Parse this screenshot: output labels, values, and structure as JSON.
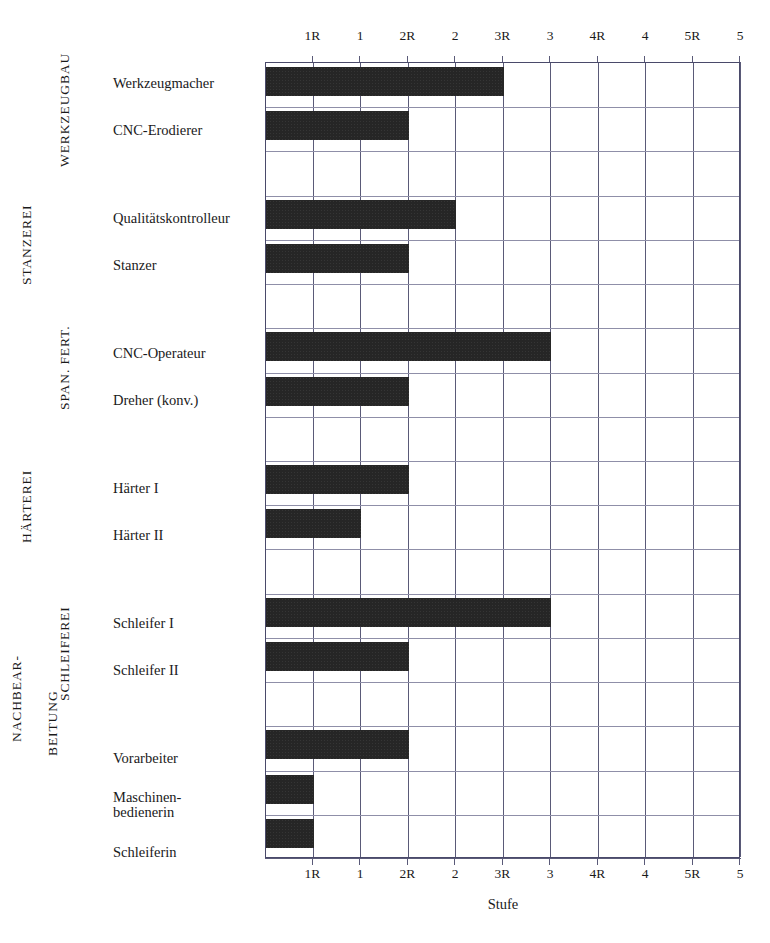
{
  "chart_data": {
    "type": "bar",
    "orientation": "horizontal",
    "title": "",
    "xlabel": "Stufe",
    "ylabel": "",
    "grid": true,
    "legend": null,
    "x_tick_labels": [
      "1R",
      "1",
      "2R",
      "2",
      "3R",
      "3",
      "4R",
      "4",
      "5R",
      "5"
    ],
    "x_tick_values": [
      1,
      2,
      3,
      4,
      5,
      6,
      7,
      8,
      9,
      10
    ],
    "xlim": [
      0,
      10
    ],
    "axis_top_duplicated": true,
    "axis_bottom_duplicated": true,
    "bar_color": "#262626",
    "grid_color": "#5a5a78",
    "groups": [
      {
        "name": "WERKZEUGBAU",
        "categories": [
          "Werkzeugmacher",
          "CNC-Erodierer"
        ],
        "value_labels": [
          "3R",
          "2R"
        ],
        "values": [
          5,
          3
        ]
      },
      {
        "name": "STANZEREI",
        "categories": [
          "Qualitätskontrolleur",
          "Stanzer"
        ],
        "value_labels": [
          "2",
          "2R"
        ],
        "values": [
          4,
          3
        ]
      },
      {
        "name": "SPAN. FERT.",
        "categories": [
          "CNC-Operateur",
          "Dreher (konv.)"
        ],
        "value_labels": [
          "3",
          "2R"
        ],
        "values": [
          6,
          3
        ]
      },
      {
        "name": "HÄRTEREI",
        "categories": [
          "Härter I",
          "Härter II"
        ],
        "value_labels": [
          "2R",
          "1"
        ],
        "values": [
          3,
          2
        ]
      },
      {
        "name": "SCHLEIFEREI",
        "categories": [
          "Schleifer I",
          "Schleifer II"
        ],
        "value_labels": [
          "3",
          "2R"
        ],
        "values": [
          6,
          3
        ]
      },
      {
        "name": "NACHBEAR-\nBEITUNG",
        "categories": [
          "Vorarbeiter",
          "Maschinen-\nbedienerin",
          "Schleiferin"
        ],
        "value_labels": [
          "2R",
          "1R",
          "1R"
        ],
        "values": [
          3,
          1,
          1
        ]
      }
    ]
  },
  "axis": {
    "top_ticks": [
      "1R",
      "1",
      "2R",
      "2",
      "3R",
      "3",
      "4R",
      "4",
      "5R",
      "5"
    ],
    "bottom_ticks": [
      "1R",
      "1",
      "2R",
      "2",
      "3R",
      "3",
      "4R",
      "4",
      "5R",
      "5"
    ],
    "x_title": "Stufe"
  },
  "group_labels": {
    "g0": "WERKZEUGBAU",
    "g1": "STANZEREI",
    "g2": "SPAN. FERT.",
    "g3": "HÄRTEREI",
    "g4": "SCHLEIFEREI",
    "g5_line1": "NACHBEAR-",
    "g5_line2": "BEITUNG"
  },
  "row_labels": {
    "r0": "Werkzeugmacher",
    "r1": "CNC-Erodierer",
    "r2": "Qualitätskontrolleur",
    "r3": "Stanzer",
    "r4": "CNC-Operateur",
    "r5": "Dreher (konv.)",
    "r6": "Härter I",
    "r7": "Härter II",
    "r8": "Schleifer I",
    "r9": "Schleifer II",
    "r10": "Vorarbeiter",
    "r11": "Maschinen-\nbedienerin",
    "r12": "Schleiferin"
  }
}
